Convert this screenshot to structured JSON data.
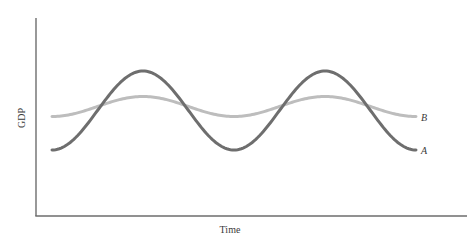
{
  "chart_data": {
    "type": "line",
    "title": "",
    "xlabel": "Time",
    "ylabel": "GDP",
    "grid": false,
    "legend": "inline labels at right end of each curve",
    "x": [
      0,
      0.25,
      0.5,
      0.75,
      1.0,
      1.25,
      1.5,
      1.75,
      2.0
    ],
    "series": [
      {
        "name": "A",
        "description": "Large-amplitude fluctuation (dark gray)",
        "color": "#6e6e6e",
        "values": [
          -1.0,
          0.0,
          1.0,
          0.0,
          -1.0,
          0.0,
          1.0,
          0.0,
          -1.0
        ]
      },
      {
        "name": "B",
        "description": "Small-amplitude fluctuation (light gray)",
        "color": "#bdbdbd",
        "values": [
          -0.25,
          0.0,
          0.25,
          0.0,
          -0.25,
          0.0,
          0.25,
          0.0,
          -0.25
        ]
      }
    ],
    "ylim": [
      -1.3,
      1.3
    ]
  },
  "labels": {
    "x_axis": "Time",
    "y_axis": "GDP",
    "series_a": "A",
    "series_b": "B"
  }
}
